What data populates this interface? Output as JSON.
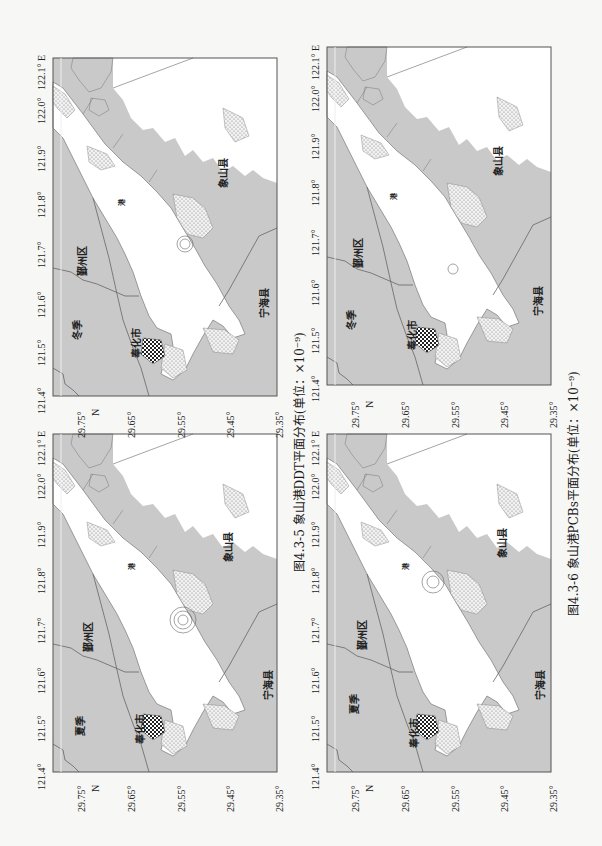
{
  "page": {
    "orientation": "rotated 90° counter-clockwise",
    "figures": [
      {
        "caption": "图4.3-5  象山港DDT平面分布(单位：×10⁻⁹)",
        "maps": [
          {
            "season": "冬季",
            "position": "top-left"
          },
          {
            "season": "夏季",
            "position": "bottom-left"
          }
        ]
      },
      {
        "caption": "图4.3-6  象山港PCBs平面分布(单位：×10⁻⁹)",
        "maps": [
          {
            "season": "冬季",
            "position": "top-right"
          },
          {
            "season": "夏季",
            "position": "bottom-right"
          }
        ]
      }
    ]
  },
  "map_common": {
    "longitude_ticks": [
      "121.4°",
      "121.5°",
      "121.6°",
      "121.7°",
      "121.8°",
      "121.9°",
      "122.0°",
      "122.1° E"
    ],
    "latitude_ticks": [
      "29.75°",
      "29.65°",
      "29.55°",
      "29.45°",
      "29.35°"
    ],
    "latitude_axis_label": "N",
    "place_names": {
      "yinzhou": "鄞州区",
      "fenghua": "奉化市",
      "xiangshan": "象山县",
      "ninghai": "宁海县",
      "harbor": "港"
    },
    "colors": {
      "land": "#c9c9c9",
      "sea": "#ffffff",
      "frame": "#555555",
      "boundary": "#666666"
    }
  },
  "maps": {
    "ddt_winter": {
      "season": "冬季"
    },
    "ddt_summer": {
      "season": "夏季"
    },
    "pcb_winter": {
      "season": "冬季"
    },
    "pcb_summer": {
      "season": "夏季"
    }
  },
  "captions": {
    "ddt": "图4.3-5  象山港DDT平面分布(单位：×10⁻⁹)",
    "pcb": "图4.3-6  象山港PCBs平面分布(单位：×10⁻⁹)"
  }
}
